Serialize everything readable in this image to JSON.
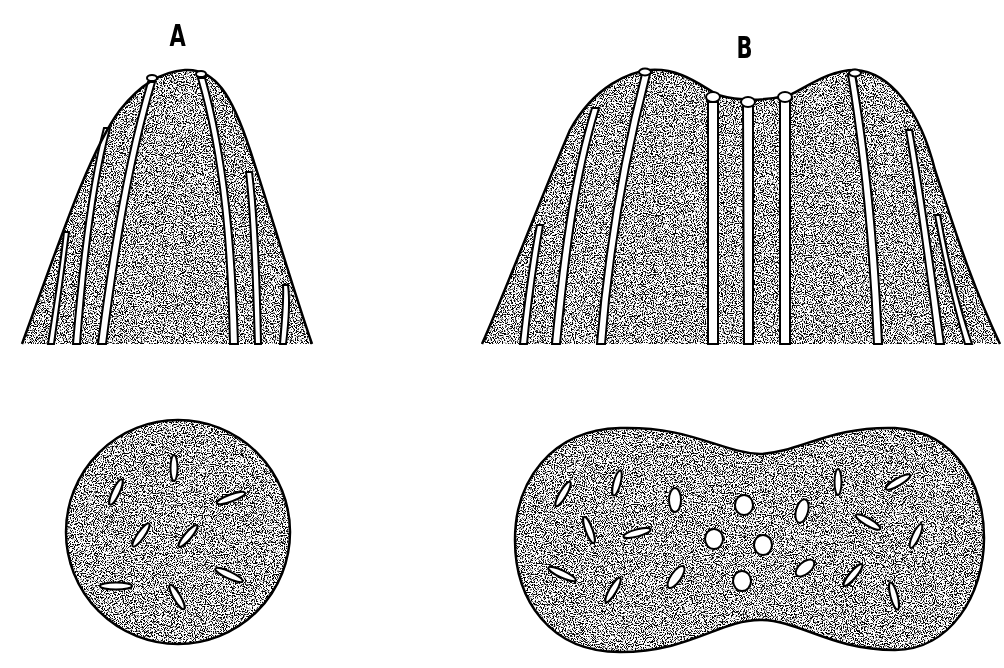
{
  "panels": [
    {
      "id": "A",
      "label": "A",
      "views": {
        "longitudinal": {
          "shape": "dome",
          "strands": 6
        },
        "cross_section": {
          "shape": "circle",
          "elongated_bundles": 8
        }
      }
    },
    {
      "id": "B",
      "label": "B",
      "views": {
        "longitudinal": {
          "shape": "double-dome",
          "strands": 9
        },
        "cross_section": {
          "shape": "dumbbell",
          "elongated_bundles": 18,
          "round_bundles": 4
        }
      }
    }
  ],
  "colors": {
    "stroke": "#000000",
    "fill": "#8a8a8a",
    "background": "#ffffff"
  }
}
